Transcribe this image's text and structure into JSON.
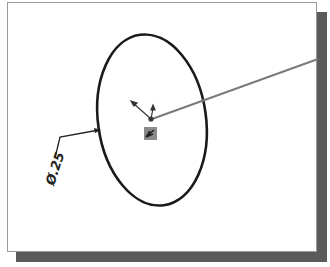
{
  "drawing": {
    "dimension_label": "Ø.25",
    "dimension_type": "diameter",
    "colors": {
      "frame_border": "#9a9a9a",
      "shadow": "#5a5a5a",
      "circle_stroke": "#1a1a1a",
      "leader_line": "#7a7a7a",
      "origin_marker": "#8a8a8a"
    }
  }
}
